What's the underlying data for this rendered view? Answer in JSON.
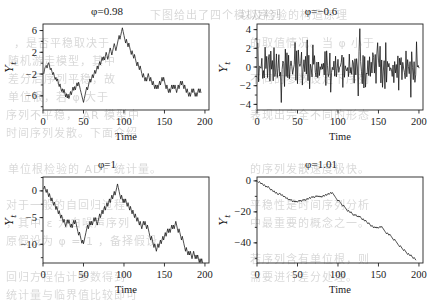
{
  "background": {
    "page_color": "#ffffff",
    "bleed_through_lines": [
      {
        "text": "下图给出了四个模拟序列",
        "x": 150,
        "y": 6
      },
      {
        "text": "，是否平稳取决于",
        "x": 14,
        "y": 34
      },
      {
        "text": "随机游走模型，其中",
        "x": 8,
        "y": 52
      },
      {
        "text": "差分后序列平稳，故",
        "x": 8,
        "y": 70
      },
      {
        "text": "单位根，若 φ 大于",
        "x": 8,
        "y": 88
      },
      {
        "text": "序列不平稳， AR 模型中",
        "x": 6,
        "y": 106
      },
      {
        "text": "时间序列发散。下面介绍",
        "x": 6,
        "y": 124
      },
      {
        "text": "单位根检验的 ADF 统计量。",
        "x": 8,
        "y": 160
      },
      {
        "text": "对于一般的自回归过程",
        "x": 6,
        "y": 196
      },
      {
        "text": "，其中 ε 为白噪声序列",
        "x": 6,
        "y": 214
      },
      {
        "text": "原假设为 φ = 1 ，备择假设",
        "x": 6,
        "y": 232
      },
      {
        "text": "回归方程估计参数得到",
        "x": 6,
        "y": 268
      },
      {
        "text": "统计量与临界值比较即可",
        "x": 6,
        "y": 286
      },
      {
        "text": "以及检验的构造原理",
        "x": 240,
        "y": 6
      },
      {
        "text": "的取值情况。当 φ 小于",
        "x": 250,
        "y": 34
      },
      {
        "text": "不同的参数设定下序列",
        "x": 250,
        "y": 70
      },
      {
        "text": "表现出完全不同的形态",
        "x": 250,
        "y": 106
      },
      {
        "text": "的序列发散速度极快。",
        "x": 250,
        "y": 160
      },
      {
        "text": "平稳性是时间序列分析",
        "x": 250,
        "y": 196
      },
      {
        "text": "中最重要的概念之一。",
        "x": 250,
        "y": 214
      },
      {
        "text": "若序列含有单位根，则",
        "x": 250,
        "y": 250
      },
      {
        "text": "需要进行差分处理。",
        "x": 250,
        "y": 268
      }
    ]
  },
  "figure": {
    "layout": {
      "rows": 2,
      "cols": 2
    },
    "shared_xlabel": "Time",
    "shared_ylabel": "Y",
    "shared_ylabel_subscript": "t",
    "line_color": "#111111",
    "axis_color": "#222222"
  },
  "chart_data": [
    {
      "id": "panel-phi-0-98",
      "type": "line",
      "title": "φ=0.98",
      "title_symbol": "φ",
      "title_value": "=0.98",
      "xlabel": "Time",
      "ylabel": "Y",
      "ylabel_sub": "t",
      "xlim": [
        0,
        205
      ],
      "ylim": [
        -8.6,
        7.2
      ],
      "xticks": [
        0,
        50,
        100,
        150,
        200
      ],
      "xticklabels": [
        "0",
        "50",
        "100",
        "150",
        "200"
      ],
      "yticks": [
        -6,
        -2,
        2,
        6
      ],
      "yticklabels": [
        "-6",
        "-2",
        "2",
        "6"
      ],
      "grid": false,
      "legend": null,
      "x": [
        1,
        2,
        3,
        4,
        5,
        6,
        7,
        8,
        9,
        10,
        11,
        12,
        13,
        14,
        15,
        16,
        17,
        18,
        19,
        20,
        21,
        22,
        23,
        24,
        25,
        26,
        27,
        28,
        29,
        30,
        31,
        32,
        33,
        34,
        35,
        36,
        37,
        38,
        39,
        40,
        41,
        42,
        43,
        44,
        45,
        46,
        47,
        48,
        49,
        50,
        51,
        52,
        53,
        54,
        55,
        56,
        57,
        58,
        59,
        60,
        61,
        62,
        63,
        64,
        65,
        66,
        67,
        68,
        69,
        70,
        71,
        72,
        73,
        74,
        75,
        76,
        77,
        78,
        79,
        80,
        81,
        82,
        83,
        84,
        85,
        86,
        87,
        88,
        89,
        90,
        91,
        92,
        93,
        94,
        95,
        96,
        97,
        98,
        99,
        100,
        101,
        102,
        103,
        104,
        105,
        106,
        107,
        108,
        109,
        110,
        111,
        112,
        113,
        114,
        115,
        116,
        117,
        118,
        119,
        120,
        121,
        122,
        123,
        124,
        125,
        126,
        127,
        128,
        129,
        130,
        131,
        132,
        133,
        134,
        135,
        136,
        137,
        138,
        139,
        140,
        141,
        142,
        143,
        144,
        145,
        146,
        147,
        148,
        149,
        150,
        151,
        152,
        153,
        154,
        155,
        156,
        157,
        158,
        159,
        160,
        161,
        162,
        163,
        164,
        165,
        166,
        167,
        168,
        169,
        170,
        171,
        172,
        173,
        174,
        175,
        176,
        177,
        178,
        179,
        180,
        181,
        182,
        183,
        184,
        185,
        186,
        187,
        188,
        189,
        190,
        191,
        192,
        193,
        194,
        195,
        196,
        197,
        198,
        199,
        200
      ],
      "y": [
        -1.9,
        -1.1,
        -0.6,
        -0.4,
        -0.9,
        -0.2,
        0.1,
        -0.5,
        -1.2,
        -0.9,
        -1.5,
        -2.1,
        -1.7,
        -2.4,
        -3.0,
        -2.6,
        -3.3,
        -2.9,
        -3.7,
        -4.3,
        -3.8,
        -4.6,
        -5.2,
        -4.7,
        -5.4,
        -4.8,
        -5.5,
        -6.2,
        -5.6,
        -6.4,
        -5.7,
        -6.5,
        -5.9,
        -5.2,
        -5.8,
        -5.1,
        -4.4,
        -5.0,
        -4.3,
        -4.9,
        -4.2,
        -3.6,
        -4.2,
        -3.5,
        -4.1,
        -4.8,
        -5.4,
        -6.0,
        -6.6,
        -7.2,
        -6.5,
        -5.8,
        -5.1,
        -4.4,
        -4.9,
        -4.2,
        -3.5,
        -2.9,
        -3.5,
        -2.8,
        -2.1,
        -2.7,
        -2.0,
        -1.3,
        -1.9,
        -1.2,
        -0.5,
        -1.1,
        -0.4,
        0.3,
        -0.3,
        0.4,
        1.1,
        0.5,
        1.2,
        0.6,
        1.3,
        2.0,
        1.4,
        0.7,
        1.4,
        2.1,
        2.8,
        2.2,
        1.5,
        2.2,
        2.9,
        3.6,
        3.0,
        2.3,
        3.0,
        3.7,
        4.4,
        5.1,
        4.4,
        5.1,
        5.8,
        6.5,
        5.8,
        5.1,
        4.4,
        3.7,
        4.4,
        3.7,
        3.0,
        3.7,
        3.0,
        2.3,
        1.6,
        2.3,
        1.6,
        0.9,
        1.6,
        0.9,
        0.2,
        -0.5,
        0.2,
        -0.5,
        -1.2,
        -0.5,
        -1.2,
        -1.9,
        -2.6,
        -1.9,
        -2.6,
        -3.3,
        -2.6,
        -3.3,
        -2.6,
        -1.9,
        -2.6,
        -3.3,
        -2.6,
        -3.3,
        -4.0,
        -3.3,
        -4.0,
        -4.7,
        -4.0,
        -4.7,
        -4.0,
        -4.7,
        -4.0,
        -3.3,
        -4.0,
        -3.3,
        -2.6,
        -3.3,
        -2.6,
        -3.3,
        -4.0,
        -4.7,
        -4.0,
        -4.7,
        -5.4,
        -4.7,
        -5.4,
        -4.7,
        -4.0,
        -4.7,
        -4.0,
        -4.7,
        -4.0,
        -4.7,
        -5.4,
        -4.7,
        -4.0,
        -4.7,
        -4.0,
        -3.3,
        -4.0,
        -3.3,
        -4.0,
        -4.7,
        -4.0,
        -4.7,
        -5.4,
        -4.7,
        -5.4,
        -6.1,
        -5.4,
        -6.1,
        -5.4,
        -4.7,
        -5.4,
        -4.7,
        -5.4,
        -6.1,
        -5.4,
        -6.1,
        -5.4,
        -4.7,
        -5.4,
        -4.7,
        -5.4
      ]
    },
    {
      "id": "panel-phi--0-6",
      "type": "line",
      "title": "φ=−0.6",
      "title_symbol": "φ",
      "title_value": "=−0.6",
      "xlabel": "Time",
      "ylabel": "Y",
      "ylabel_sub": "t",
      "xlim": [
        0,
        205
      ],
      "ylim": [
        -4.6,
        4.6
      ],
      "xticks": [
        0,
        50,
        100,
        150,
        200
      ],
      "xticklabels": [
        "0",
        "50",
        "100",
        "150",
        "200"
      ],
      "yticks": [
        -4,
        -2,
        0,
        2,
        4
      ],
      "yticklabels": [
        "-4",
        "-2",
        "0",
        "2",
        "4"
      ],
      "grid": false,
      "legend": null,
      "noise_seed": 7,
      "description": "high-frequency oscillating white-noise-like AR(1) with negative phi; most values within +/-1.5, occasional spikes to +/-3 and one near -3.8 around t=30, +4.1 near t=127"
    },
    {
      "id": "panel-phi-1",
      "type": "line",
      "title": "φ=1",
      "title_symbol": "φ",
      "title_value": "=1",
      "xlabel": "Time",
      "ylabel": "Y",
      "ylabel_sub": "t",
      "xlim": [
        0,
        205
      ],
      "ylim": [
        -13.5,
        2.6
      ],
      "xticks": [
        0,
        50,
        100,
        150,
        200
      ],
      "xticklabels": [
        "0",
        "50",
        "100",
        "150",
        "200"
      ],
      "yticks": [
        -10,
        -5,
        0
      ],
      "yticklabels": [
        "-10",
        "-5",
        "0"
      ],
      "grid": false,
      "legend": null,
      "y": [
        0.4,
        0.9,
        0.2,
        -0.3,
        0.3,
        -0.4,
        -1.1,
        -0.5,
        -1.2,
        -1.9,
        -1.3,
        -2.0,
        -2.7,
        -2.1,
        -2.8,
        -3.5,
        -2.9,
        -3.6,
        -4.3,
        -3.7,
        -4.4,
        -5.1,
        -4.5,
        -5.2,
        -5.9,
        -5.3,
        -6.0,
        -6.7,
        -6.1,
        -5.4,
        -6.1,
        -5.4,
        -6.1,
        -6.8,
        -6.2,
        -6.9,
        -6.2,
        -5.5,
        -6.2,
        -5.5,
        -6.2,
        -6.9,
        -7.6,
        -8.3,
        -7.7,
        -8.4,
        -9.1,
        -9.8,
        -9.2,
        -9.9,
        -9.2,
        -8.5,
        -7.8,
        -7.1,
        -6.4,
        -7.1,
        -6.4,
        -5.7,
        -6.4,
        -5.7,
        -6.4,
        -5.7,
        -5.0,
        -5.7,
        -5.0,
        -5.7,
        -6.4,
        -5.7,
        -5.0,
        -4.3,
        -5.0,
        -4.3,
        -3.6,
        -4.3,
        -3.6,
        -2.9,
        -3.6,
        -2.9,
        -2.2,
        -2.9,
        -2.2,
        -1.5,
        -2.2,
        -1.5,
        -0.8,
        -1.5,
        -0.8,
        -0.1,
        -0.8,
        -0.1,
        0.6,
        1.3,
        0.6,
        -0.1,
        -0.8,
        -1.5,
        -0.8,
        -1.5,
        -2.2,
        -1.5,
        -2.2,
        -1.5,
        -2.2,
        -2.9,
        -2.2,
        -2.9,
        -3.6,
        -2.9,
        -3.6,
        -4.3,
        -3.6,
        -4.3,
        -5.0,
        -4.3,
        -5.0,
        -5.7,
        -5.0,
        -5.7,
        -6.4,
        -5.7,
        -6.4,
        -7.1,
        -6.4,
        -5.7,
        -6.4,
        -5.7,
        -6.4,
        -7.1,
        -6.4,
        -7.1,
        -7.8,
        -8.5,
        -9.2,
        -8.5,
        -9.2,
        -9.9,
        -10.6,
        -9.9,
        -10.6,
        -11.3,
        -10.6,
        -9.9,
        -10.6,
        -9.9,
        -9.2,
        -9.9,
        -9.2,
        -8.5,
        -9.2,
        -8.5,
        -7.8,
        -8.5,
        -7.8,
        -7.1,
        -7.8,
        -7.1,
        -7.8,
        -7.1,
        -6.4,
        -7.1,
        -6.4,
        -7.1,
        -6.4,
        -5.7,
        -6.4,
        -7.1,
        -7.8,
        -7.1,
        -7.8,
        -8.5,
        -9.2,
        -8.5,
        -9.2,
        -9.9,
        -10.6,
        -11.3,
        -10.6,
        -11.3,
        -12.0,
        -11.3,
        -12.0,
        -11.3,
        -12.0,
        -12.7,
        -12.0,
        -11.3,
        -12.0,
        -12.7,
        -12.0,
        -12.7,
        -12.0,
        -12.7,
        -13.4,
        -12.7,
        -13.4,
        -12.7,
        -13.4
      ]
    },
    {
      "id": "panel-phi-1-01",
      "type": "line",
      "title": "φ=1.01",
      "title_symbol": "φ",
      "title_value": "=1.01",
      "xlabel": "Time",
      "ylabel": "Y",
      "ylabel_sub": "t",
      "xlim": [
        0,
        205
      ],
      "ylim": [
        -53,
        2.5
      ],
      "xticks": [
        0,
        50,
        100,
        150,
        200
      ],
      "xticklabels": [
        "0",
        "50",
        "100",
        "150",
        "200"
      ],
      "yticks": [
        -40,
        -20,
        0
      ],
      "yticklabels": [
        "-40",
        "-20",
        "0"
      ],
      "grid": false,
      "legend": null,
      "y": [
        -0.5,
        -1.0,
        -0.4,
        -1.2,
        -2.0,
        -1.4,
        -2.2,
        -3.0,
        -2.4,
        -3.2,
        -4.0,
        -3.4,
        -4.2,
        -3.6,
        -4.4,
        -5.2,
        -6.0,
        -5.4,
        -6.2,
        -7.0,
        -6.4,
        -7.2,
        -8.0,
        -7.4,
        -8.2,
        -9.0,
        -8.4,
        -7.8,
        -8.6,
        -9.4,
        -8.8,
        -9.6,
        -10.4,
        -9.8,
        -10.6,
        -11.4,
        -10.8,
        -11.6,
        -12.4,
        -11.8,
        -12.6,
        -11.9,
        -12.7,
        -13.5,
        -12.8,
        -13.6,
        -12.9,
        -13.7,
        -13.0,
        -13.8,
        -13.1,
        -12.4,
        -13.2,
        -12.5,
        -13.3,
        -12.6,
        -11.9,
        -12.7,
        -11.9,
        -12.7,
        -11.9,
        -11.2,
        -12.0,
        -11.3,
        -10.6,
        -11.4,
        -10.7,
        -10.0,
        -10.8,
        -10.1,
        -10.9,
        -10.2,
        -9.5,
        -10.3,
        -9.6,
        -10.4,
        -9.7,
        -10.5,
        -9.8,
        -10.6,
        -9.9,
        -9.2,
        -10.0,
        -9.3,
        -8.6,
        -9.4,
        -8.7,
        -8.0,
        -8.8,
        -8.1,
        -7.4,
        -8.2,
        -7.5,
        -8.3,
        -9.1,
        -9.9,
        -10.7,
        -11.5,
        -12.3,
        -13.1,
        -12.4,
        -13.2,
        -14.0,
        -14.8,
        -15.6,
        -16.4,
        -15.7,
        -16.5,
        -17.3,
        -18.1,
        -18.9,
        -19.7,
        -19.0,
        -19.8,
        -20.6,
        -19.9,
        -20.7,
        -21.5,
        -22.3,
        -21.6,
        -22.4,
        -21.7,
        -22.5,
        -23.3,
        -22.6,
        -23.4,
        -22.7,
        -23.5,
        -24.3,
        -25.1,
        -24.4,
        -25.2,
        -26.0,
        -25.3,
        -26.1,
        -26.9,
        -27.7,
        -27.0,
        -27.8,
        -28.6,
        -29.4,
        -28.7,
        -29.5,
        -30.3,
        -29.6,
        -30.4,
        -29.7,
        -30.5,
        -29.8,
        -30.6,
        -30.0,
        -29.3,
        -30.1,
        -29.4,
        -30.2,
        -31.0,
        -31.8,
        -32.6,
        -33.4,
        -34.2,
        -33.5,
        -34.3,
        -35.1,
        -34.4,
        -35.2,
        -36.0,
        -36.8,
        -37.6,
        -38.4,
        -37.7,
        -38.5,
        -39.3,
        -40.1,
        -40.9,
        -41.7,
        -42.5,
        -41.8,
        -42.6,
        -43.4,
        -44.2,
        -45.0,
        -44.3,
        -45.1,
        -45.9,
        -46.7,
        -47.5,
        -46.8,
        -47.6,
        -48.4,
        -47.7,
        -48.5,
        -49.3,
        -50.1,
        -49.4,
        -50.2,
        -51.0
      ]
    }
  ]
}
